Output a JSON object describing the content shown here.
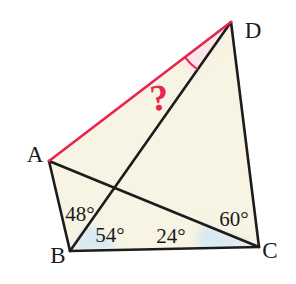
{
  "figure": {
    "vertices": {
      "a": "A",
      "b": "B",
      "c": "C",
      "d": "D"
    },
    "angles": {
      "abd": "48°",
      "dbc": "54°",
      "acb": "24°",
      "dca": "60°",
      "adb": "?"
    },
    "colors": {
      "highlight_red": "#e8234f",
      "line_black": "#1c1c1c",
      "fill_cream": "#f8f4e3",
      "fill_blue": "#d7e9f2",
      "fill_pink": "#fae4ea",
      "background": "#ffffff"
    }
  }
}
